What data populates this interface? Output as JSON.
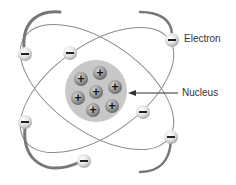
{
  "diagram": {
    "type": "atom-model",
    "labels": {
      "electron": "Electron",
      "nucleus": "Nucleus"
    },
    "nucleus": {
      "proton_count": 7,
      "proton_symbol": "+",
      "fill_color": "#c8c8c8"
    },
    "electrons": {
      "count": 8,
      "symbol": "−"
    },
    "orbits": 2,
    "colors": {
      "orbit": "#8a8a8a",
      "orbit_thick": "#6e6e6e",
      "text": "#333333",
      "background": "#ffffff"
    }
  }
}
